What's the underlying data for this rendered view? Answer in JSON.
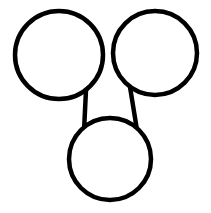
{
  "canvas": {
    "width": 211,
    "height": 213,
    "background_color": "#ffffff",
    "title": "Three circle node diagram"
  },
  "style": {
    "stroke_color": "#000000",
    "fill_color": "#ffffff",
    "node_stroke_width": 4.5,
    "edge_stroke_width": 4.5
  },
  "diagram": {
    "type": "node-link",
    "node_count": 3,
    "edge_count": 2,
    "nodes": [
      {
        "id": "node-top-left",
        "name": "top-left-circle",
        "label": "",
        "cx": 59,
        "cy": 55,
        "r": 44,
        "stroke": "#000000",
        "fill": "#ffffff"
      },
      {
        "id": "node-top-right",
        "name": "top-right-circle",
        "label": "",
        "cx": 155,
        "cy": 53,
        "r": 42,
        "stroke": "#000000",
        "fill": "#ffffff"
      },
      {
        "id": "node-bottom",
        "name": "bottom-circle",
        "label": "",
        "cx": 110,
        "cy": 159,
        "r": 41,
        "stroke": "#000000",
        "fill": "#ffffff"
      }
    ],
    "edges": [
      {
        "id": "edge-left",
        "name": "edge-top-left-to-bottom",
        "from": "node-top-left",
        "to": "node-bottom",
        "x1": 86,
        "y1": 90,
        "x2": 84,
        "y2": 131,
        "stroke": "#000000"
      },
      {
        "id": "edge-right",
        "name": "edge-top-right-to-bottom",
        "from": "node-top-right",
        "to": "node-bottom",
        "x1": 130,
        "y1": 87,
        "x2": 137,
        "y2": 130,
        "stroke": "#000000"
      }
    ]
  }
}
